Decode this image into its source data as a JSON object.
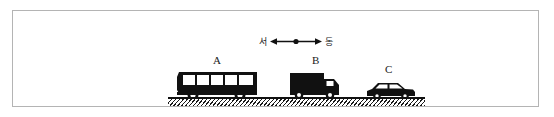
{
  "figure": {
    "frame_border_color": "#b4b4b4",
    "background_color": "#ffffff",
    "ink_color": "#111111"
  },
  "direction_indicator": {
    "west_label": "서",
    "east_label": "동",
    "arrow_icon": "double-headed-horizontal-arrow",
    "center_marker": "filled-dot"
  },
  "ground": {
    "surface_icon": "hatched-ground-line",
    "line_color": "#111111"
  },
  "vehicles": [
    {
      "id": "A",
      "label": "A",
      "type": "bus",
      "icon": "bus-silhouette-icon",
      "window_count": 5,
      "wheel_count": 2,
      "color": "#111111"
    },
    {
      "id": "B",
      "label": "B",
      "type": "truck",
      "icon": "box-truck-silhouette-icon",
      "window_count": 1,
      "wheel_count": 2,
      "color": "#111111"
    },
    {
      "id": "C",
      "label": "C",
      "type": "car",
      "icon": "sedan-car-silhouette-icon",
      "window_count": 2,
      "wheel_count": 2,
      "color": "#111111"
    }
  ]
}
